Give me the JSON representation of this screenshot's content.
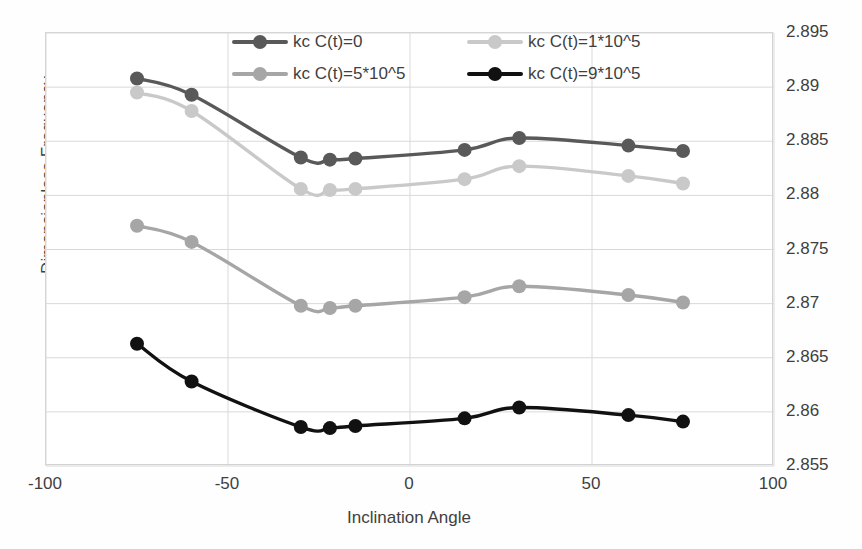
{
  "chart_data": {
    "type": "line",
    "title": "",
    "xlabel": "Inclination Angle",
    "ylabel": "Dimensionless Frequency",
    "xlim": [
      -100,
      100
    ],
    "ylim": [
      2.855,
      2.895
    ],
    "xticks": [
      -100,
      -50,
      0,
      50,
      100
    ],
    "xtick_labels": [
      "-100",
      "-50",
      "0",
      "50",
      "100"
    ],
    "yticks": [
      2.855,
      2.86,
      2.865,
      2.87,
      2.875,
      2.88,
      2.885,
      2.89,
      2.895
    ],
    "ytick_labels": [
      "2.855",
      "2.86",
      "2.865",
      "2.87",
      "2.875",
      "2.88",
      "2.885",
      "2.89",
      "2.895"
    ],
    "y_axis_position": "right",
    "grid": true,
    "legend_position": "top-center",
    "x": [
      -75,
      -60,
      -30,
      -22,
      -15,
      15,
      30,
      60,
      75
    ],
    "series": [
      {
        "name": "kc C(t)=0",
        "color": "#595959",
        "values": [
          2.8908,
          2.8893,
          2.8835,
          2.8833,
          2.8834,
          2.8842,
          2.8853,
          2.8846,
          2.8841
        ]
      },
      {
        "name": "kc C(t)=1*10^5",
        "color": "#c9c9c9",
        "values": [
          2.8895,
          2.8878,
          2.8806,
          2.8805,
          2.8806,
          2.8815,
          2.8827,
          2.8818,
          2.8811
        ]
      },
      {
        "name": "kc C(t)=5*10^5",
        "color": "#a6a6a6",
        "values": [
          2.8772,
          2.8757,
          2.8698,
          2.8696,
          2.8698,
          2.8706,
          2.8716,
          2.8708,
          2.8701
        ]
      },
      {
        "name": "kc C(t)=9*10^5",
        "color": "#111111",
        "values": [
          2.8663,
          2.8628,
          2.8586,
          2.8585,
          2.8587,
          2.8594,
          2.8604,
          2.8597,
          2.8591
        ]
      }
    ]
  },
  "legend": {
    "entries": [
      {
        "label": "kc C(t)=0"
      },
      {
        "label": "kc C(t)=1*10^5"
      },
      {
        "label": "kc C(t)=5*10^5"
      },
      {
        "label": "kc C(t)=9*10^5"
      }
    ]
  },
  "axes": {
    "x_title": "Inclination Angle",
    "y_title": "Dimensionless Frequency"
  },
  "colors": {
    "series_0": "#595959",
    "series_1": "#c9c9c9",
    "series_2": "#a6a6a6",
    "series_3": "#111111",
    "grid": "#d9d9d9",
    "frame": "#d2d2d2",
    "text": "#3f3f3f",
    "background": "#ffffff"
  }
}
